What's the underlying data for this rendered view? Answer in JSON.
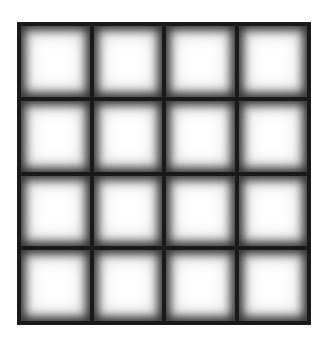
{
  "figure": {
    "type": "grid",
    "rows": 4,
    "columns": 4,
    "cell_count": 16,
    "background_color": "#ffffff",
    "line_color": "#1a1a1a",
    "cell_color": "#ffffff",
    "cells": [
      {
        "row": 1,
        "col": 1
      },
      {
        "row": 1,
        "col": 2
      },
      {
        "row": 1,
        "col": 3
      },
      {
        "row": 1,
        "col": 4
      },
      {
        "row": 2,
        "col": 1
      },
      {
        "row": 2,
        "col": 2
      },
      {
        "row": 2,
        "col": 3
      },
      {
        "row": 2,
        "col": 4
      },
      {
        "row": 3,
        "col": 1
      },
      {
        "row": 3,
        "col": 2
      },
      {
        "row": 3,
        "col": 3
      },
      {
        "row": 3,
        "col": 4
      },
      {
        "row": 4,
        "col": 1
      },
      {
        "row": 4,
        "col": 2
      },
      {
        "row": 4,
        "col": 3
      },
      {
        "row": 4,
        "col": 4
      }
    ]
  }
}
